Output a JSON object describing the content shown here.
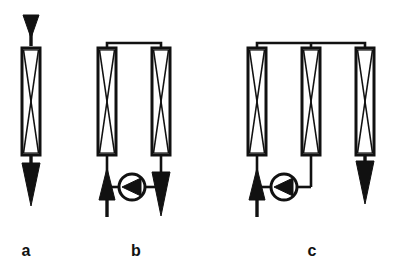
{
  "figure": {
    "width": 395,
    "height": 273,
    "background_color": "#ffffff",
    "line_color": "#111111",
    "fill_color": "#ffffff"
  },
  "panels": [
    {
      "id": "a",
      "label": "a",
      "description": "Single column, single pass, flow top to bottom",
      "column_count": 1,
      "pump_count": 0,
      "inlet": {
        "symbol": "arrow-down",
        "position": "top",
        "label": ""
      },
      "outlet": {
        "symbol": "arrow-down",
        "position": "bottom",
        "label": ""
      },
      "columns": [
        {
          "name": "column-a1",
          "x": 22,
          "y": 48,
          "width": 18,
          "height": 107,
          "packing": "bowtie-x"
        }
      ]
    },
    {
      "id": "b",
      "label": "b",
      "description": "Two columns joined at top, recirculating pump at bottom",
      "column_count": 2,
      "pump_count": 1,
      "inlet": {
        "symbol": "arrow-up",
        "position": "bottom-left",
        "label": ""
      },
      "outlet": {
        "symbol": "arrow-down",
        "position": "bottom-right",
        "label": ""
      },
      "columns": [
        {
          "name": "column-b1",
          "x": 98,
          "y": 48,
          "width": 18,
          "height": 107,
          "packing": "bowtie-x"
        },
        {
          "name": "column-b2",
          "x": 152,
          "y": 48,
          "width": 18,
          "height": 107,
          "packing": "bowtie-x"
        }
      ],
      "pumps": [
        {
          "name": "pump-b1",
          "cx": 132,
          "cy": 187,
          "r": 13,
          "symbol": "pump-triangle-left"
        }
      ],
      "top_manifold": {
        "y": 43,
        "from_x": 107,
        "to_x": 161
      }
    },
    {
      "id": "c",
      "label": "c",
      "description": "Three columns joined by a common top manifold, pump between first and second column",
      "column_count": 3,
      "pump_count": 1,
      "inlet": {
        "symbol": "arrow-up",
        "position": "bottom-left",
        "label": ""
      },
      "outlet": {
        "symbol": "arrow-down",
        "position": "bottom-right",
        "label": ""
      },
      "columns": [
        {
          "name": "column-c1",
          "x": 248,
          "y": 48,
          "width": 18,
          "height": 107,
          "packing": "bowtie-x"
        },
        {
          "name": "column-c2",
          "x": 302,
          "y": 48,
          "width": 18,
          "height": 107,
          "packing": "bowtie-x"
        },
        {
          "name": "column-c3",
          "x": 356,
          "y": 48,
          "width": 18,
          "height": 107,
          "packing": "bowtie-x"
        }
      ],
      "pumps": [
        {
          "name": "pump-c1",
          "cx": 284,
          "cy": 187,
          "r": 13,
          "symbol": "pump-triangle-left"
        }
      ],
      "top_manifold": {
        "y": 43,
        "from_x": 257,
        "to_x": 365
      }
    }
  ]
}
